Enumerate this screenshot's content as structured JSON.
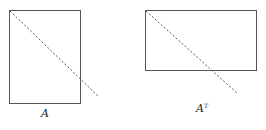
{
  "diagram": {
    "matrices": [
      {
        "name": "A",
        "label": "A",
        "superscript": "",
        "shape": "tall",
        "rect": {
          "x": 9.5,
          "y": 10.5,
          "w": 71,
          "h": 93
        },
        "diagonal": {
          "x1": 10,
          "y1": 11,
          "x2": 99,
          "y2": 97
        },
        "label_pos": {
          "x": 41,
          "y": 117
        }
      },
      {
        "name": "A-transpose",
        "label": "A",
        "superscript": "T",
        "shape": "wide",
        "rect": {
          "x": 145.5,
          "y": 10.5,
          "w": 111,
          "h": 60
        },
        "diagonal": {
          "x1": 146,
          "y1": 11,
          "x2": 237,
          "y2": 93
        },
        "label_pos": {
          "x": 196,
          "y": 112
        }
      }
    ],
    "colors": {
      "rect_stroke": "#555555",
      "diagonal": "#555555",
      "text": "#222222"
    }
  }
}
